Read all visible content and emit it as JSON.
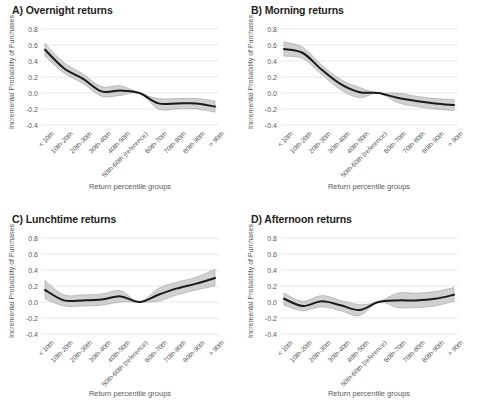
{
  "figure": {
    "width": 478,
    "height": 417,
    "background": "#ffffff",
    "line_color": "#1a1a1a",
    "band_color": "#bfbfbf",
    "grid_color": "#d9d9d9"
  },
  "axes": {
    "xlabel": "Return percentile groups",
    "ylabel": "Incremental Probability of Purchases",
    "ytick_labels": [
      "0.8",
      "0.6",
      "0.4",
      "0.2",
      "0.0",
      "-0.2",
      "-0.4"
    ],
    "ytick_values": [
      0.8,
      0.6,
      0.4,
      0.2,
      0.0,
      -0.2,
      -0.4
    ],
    "ylim": [
      -0.45,
      0.85
    ],
    "grid": "horizontal",
    "categories": [
      "< 10th",
      "10th-20th",
      "20th-30th",
      "30th-40th",
      "40th-50th",
      "50th-60th (reference)",
      "60th-70th",
      "70th-80th",
      "80th-90th",
      "> 90th"
    ]
  },
  "panels": [
    {
      "id": "A",
      "title": "A) Overnight returns"
    },
    {
      "id": "B",
      "title": "B) Morning returns"
    },
    {
      "id": "C",
      "title": "C) Lunchtime returns"
    },
    {
      "id": "D",
      "title": "D) Afternoon returns"
    }
  ],
  "chart_data": [
    {
      "type": "line",
      "title": "A) Overnight returns",
      "xlabel": "Return percentile groups",
      "ylabel": "Incremental Probability of Purchases",
      "ylim": [
        -0.45,
        0.85
      ],
      "grid": true,
      "legend": "none",
      "categories": [
        "< 10th",
        "10th-20th",
        "20th-30th",
        "30th-40th",
        "40th-50th",
        "50th-60th (reference)",
        "60th-70th",
        "70th-80th",
        "80th-90th",
        "> 90th"
      ],
      "series": [
        {
          "name": "estimate",
          "values": [
            0.54,
            0.31,
            0.18,
            0.02,
            0.03,
            0.0,
            -0.13,
            -0.13,
            -0.13,
            -0.17
          ]
        },
        {
          "name": "ci_upper",
          "values": [
            0.62,
            0.38,
            0.24,
            0.08,
            0.09,
            0.0,
            -0.07,
            -0.07,
            -0.07,
            -0.1
          ]
        },
        {
          "name": "ci_lower",
          "values": [
            0.46,
            0.25,
            0.12,
            -0.04,
            -0.03,
            0.0,
            -0.2,
            -0.2,
            -0.2,
            -0.24
          ]
        }
      ]
    },
    {
      "type": "line",
      "title": "B) Morning returns",
      "xlabel": "Return percentile groups",
      "ylabel": "Incremental Probability of Purchases",
      "ylim": [
        -0.45,
        0.85
      ],
      "grid": true,
      "legend": "none",
      "categories": [
        "< 10th",
        "10th-20th",
        "20th-30th",
        "30th-40th",
        "40th-50th",
        "50th-60th (reference)",
        "60th-70th",
        "70th-80th",
        "80th-90th",
        "> 90th"
      ],
      "series": [
        {
          "name": "estimate",
          "values": [
            0.55,
            0.5,
            0.29,
            0.11,
            0.01,
            0.0,
            -0.06,
            -0.1,
            -0.13,
            -0.15
          ]
        },
        {
          "name": "ci_upper",
          "values": [
            0.64,
            0.57,
            0.35,
            0.17,
            0.07,
            0.0,
            0.0,
            -0.04,
            -0.07,
            -0.08
          ]
        },
        {
          "name": "ci_lower",
          "values": [
            0.46,
            0.43,
            0.23,
            0.04,
            -0.06,
            0.0,
            -0.12,
            -0.17,
            -0.2,
            -0.22
          ]
        }
      ]
    },
    {
      "type": "line",
      "title": "C) Lunchtime returns",
      "xlabel": "Return percentile groups",
      "ylabel": "Incremental Probability of Purchases",
      "ylim": [
        -0.45,
        0.85
      ],
      "grid": true,
      "legend": "none",
      "categories": [
        "< 10th",
        "10th-20th",
        "20th-30th",
        "30th-40th",
        "40th-50th",
        "50th-60th (reference)",
        "60th-70th",
        "70th-80th",
        "80th-90th",
        "> 90th"
      ],
      "series": [
        {
          "name": "estimate",
          "values": [
            0.15,
            0.02,
            0.02,
            0.03,
            0.07,
            0.0,
            0.09,
            0.17,
            0.23,
            0.3
          ]
        },
        {
          "name": "ci_upper",
          "values": [
            0.27,
            0.09,
            0.09,
            0.1,
            0.14,
            0.0,
            0.17,
            0.25,
            0.31,
            0.41
          ]
        },
        {
          "name": "ci_lower",
          "values": [
            0.04,
            -0.05,
            -0.05,
            -0.04,
            0.0,
            0.0,
            0.01,
            0.09,
            0.15,
            0.2
          ]
        }
      ]
    },
    {
      "type": "line",
      "title": "D) Afternoon returns",
      "xlabel": "Return percentile groups",
      "ylabel": "Incremental Probability of Purchases",
      "ylim": [
        -0.45,
        0.85
      ],
      "grid": true,
      "legend": "none",
      "categories": [
        "< 10th",
        "10th-20th",
        "20th-30th",
        "30th-40th",
        "40th-50th",
        "50th-60th (reference)",
        "60th-70th",
        "70th-80th",
        "80th-90th",
        "> 90th"
      ],
      "series": [
        {
          "name": "estimate",
          "values": [
            0.04,
            -0.05,
            0.01,
            -0.04,
            -0.1,
            0.0,
            0.02,
            0.02,
            0.04,
            0.09
          ]
        },
        {
          "name": "ci_upper",
          "values": [
            0.11,
            0.01,
            0.08,
            0.02,
            -0.03,
            0.0,
            0.11,
            0.11,
            0.13,
            0.18
          ]
        },
        {
          "name": "ci_lower",
          "values": [
            -0.04,
            -0.11,
            -0.06,
            -0.11,
            -0.17,
            0.0,
            -0.07,
            -0.07,
            -0.05,
            0.01
          ]
        }
      ]
    }
  ]
}
